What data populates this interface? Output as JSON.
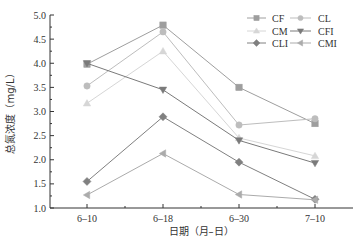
{
  "chart_data": {
    "type": "line",
    "title": "",
    "xlabel": "日期（月–日）",
    "ylabel": "总氮浓度（mg/L）",
    "categories": [
      "6–10",
      "6–18",
      "6–30",
      "7–10"
    ],
    "ylim": [
      1.0,
      5.0
    ],
    "yticks": [
      "1.0",
      "1.5",
      "2.0",
      "2.5",
      "3.0",
      "3.5",
      "4.0",
      "4.5",
      "5.0"
    ],
    "grid": false,
    "legend_position": "top-right",
    "series": [
      {
        "name": "CF",
        "marker": "square",
        "color": "#9e9e9e",
        "values": [
          3.98,
          4.79,
          3.5,
          2.75
        ]
      },
      {
        "name": "CL",
        "marker": "circle",
        "color": "#bdbdbd",
        "values": [
          3.53,
          4.65,
          2.72,
          2.85
        ]
      },
      {
        "name": "CM",
        "marker": "triangle-up",
        "color": "#d6d6d6",
        "values": [
          3.17,
          4.25,
          2.45,
          2.08
        ]
      },
      {
        "name": "CFI",
        "marker": "triangle-down",
        "color": "#7a7a7a",
        "values": [
          4.0,
          3.45,
          2.4,
          1.93
        ]
      },
      {
        "name": "CLI",
        "marker": "diamond",
        "color": "#808080",
        "values": [
          1.55,
          2.89,
          1.95,
          1.18
        ]
      },
      {
        "name": "CMI",
        "marker": "triangle-left",
        "color": "#ababab",
        "values": [
          1.27,
          2.13,
          1.28,
          1.17
        ]
      }
    ]
  }
}
